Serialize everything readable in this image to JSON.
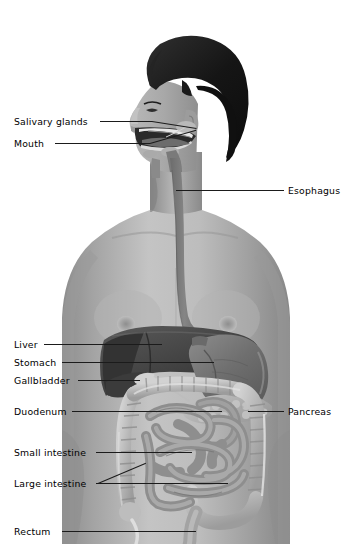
{
  "diagram": {
    "background_color": "#ffffff",
    "width": 349,
    "height": 558
  },
  "palette": {
    "background": "#ffffff",
    "skin_light": "#c9c9c9",
    "skin_mid": "#a9a9a9",
    "skin_shadow": "#8e8e8e",
    "skin_deep": "#7b7b7b",
    "hair": "#171717",
    "hair_highlight": "#3a3a3a",
    "esophagus": "#7c7c7c",
    "esophagus_dark": "#6a6a6a",
    "liver": "#4b4b4b",
    "liver_dark": "#353535",
    "stomach": "#6f6f6f",
    "stomach_light": "#858585",
    "gallbladder": "#cfcfcf",
    "pancreas": "#b4b4b4",
    "small_intestine": "#9a9a9a",
    "small_intestine_dark": "#7f7f7f",
    "large_intestine": "#b9b9b9",
    "large_intestine_edge": "#dcdcdc",
    "rectum": "#a0a0a0",
    "leader_line": "#1b1b1b",
    "text": "#000000"
  },
  "labels": [
    {
      "id": "salivary-glands",
      "text": "Salivary glands",
      "side": "left",
      "text_x": 14,
      "text_y": 116,
      "leader_x1": 100,
      "leader_y": 121,
      "leader_x2": 152,
      "diag_to_x": 196,
      "diag_to_y": 128
    },
    {
      "id": "mouth",
      "text": "Mouth",
      "side": "left",
      "text_x": 14,
      "text_y": 138,
      "leader_x1": 55,
      "leader_y": 143,
      "leader_x2": 150,
      "diag_to_x": 196,
      "diag_to_y": 130
    },
    {
      "id": "esophagus",
      "text": "Esophagus",
      "side": "right",
      "text_x": 288,
      "text_y": 185,
      "leader_x1": 265,
      "leader_y": 190,
      "leader_x2": 284,
      "diag_to_x": 175,
      "diag_to_y": 190
    },
    {
      "id": "liver",
      "text": "Liver",
      "side": "left",
      "text_x": 14,
      "text_y": 339,
      "leader_x1": 44,
      "leader_y": 344,
      "leader_x2": 160,
      "diag_to_x": 0,
      "diag_to_y": 0
    },
    {
      "id": "stomach",
      "text": "Stomach",
      "side": "left",
      "text_x": 14,
      "text_y": 357,
      "leader_x1": 62,
      "leader_y": 362,
      "leader_x2": 212,
      "diag_to_x": 0,
      "diag_to_y": 0
    },
    {
      "id": "gallbladder",
      "text": "Gallbladder",
      "side": "left",
      "text_x": 14,
      "text_y": 375,
      "leader_x1": 78,
      "leader_y": 380,
      "leader_x2": 138,
      "diag_to_x": 0,
      "diag_to_y": 0
    },
    {
      "id": "duodenum",
      "text": "Duodenum",
      "side": "left",
      "text_x": 14,
      "text_y": 406,
      "leader_x1": 72,
      "leader_y": 411,
      "leader_x2": 222,
      "diag_to_x": 0,
      "diag_to_y": 0
    },
    {
      "id": "pancreas",
      "text": "Pancreas",
      "side": "right",
      "text_x": 288,
      "text_y": 406,
      "leader_x1": 248,
      "leader_y": 411,
      "leader_x2": 284,
      "diag_to_x": 0,
      "diag_to_y": 0
    },
    {
      "id": "small-intestine",
      "text": "Small intestine",
      "side": "left",
      "text_x": 14,
      "text_y": 447,
      "leader_x1": 96,
      "leader_y": 452,
      "leader_x2": 192,
      "diag_to_x": 0,
      "diag_to_y": 0
    },
    {
      "id": "large-intestine",
      "text": "Large intestine",
      "side": "left",
      "text_x": 14,
      "text_y": 478,
      "leader_x1": 96,
      "leader_y": 483,
      "leader_x2": 228,
      "diag_to_x": 148,
      "diag_to_y": 462
    },
    {
      "id": "rectum",
      "text": "Rectum",
      "side": "left",
      "text_x": 14,
      "text_y": 526,
      "leader_x1": 62,
      "leader_y": 531,
      "leader_x2": 196,
      "diag_to_x": 0,
      "diag_to_y": 0
    }
  ],
  "organs": [
    {
      "id": "salivary-glands",
      "name": "Salivary glands"
    },
    {
      "id": "mouth",
      "name": "Mouth"
    },
    {
      "id": "esophagus",
      "name": "Esophagus"
    },
    {
      "id": "liver",
      "name": "Liver"
    },
    {
      "id": "stomach",
      "name": "Stomach"
    },
    {
      "id": "gallbladder",
      "name": "Gallbladder"
    },
    {
      "id": "duodenum",
      "name": "Duodenum"
    },
    {
      "id": "pancreas",
      "name": "Pancreas"
    },
    {
      "id": "small-intestine",
      "name": "Small intestine"
    },
    {
      "id": "large-intestine",
      "name": "Large intestine"
    },
    {
      "id": "rectum",
      "name": "Rectum"
    }
  ]
}
